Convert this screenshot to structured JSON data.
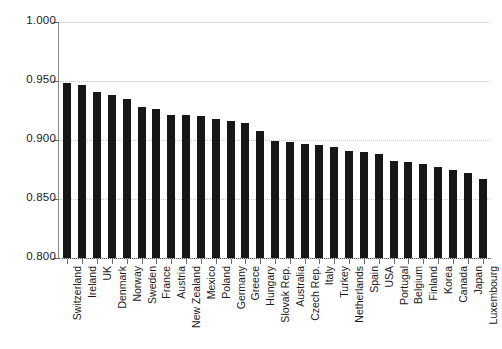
{
  "chart_data": {
    "type": "bar",
    "title": "",
    "subtitle": "",
    "xlabel": "",
    "ylabel": "",
    "ylim": [
      0.8,
      1.0
    ],
    "ytick_labels": [
      "1.000",
      "0.950",
      "0.900",
      "0.850",
      "0.800"
    ],
    "ytick_values": [
      1.0,
      0.95,
      0.9,
      0.85,
      0.8
    ],
    "grid": "horizontal-dotted",
    "legend": "none",
    "bar_color": "#171717",
    "categories": [
      "Switzerland",
      "Ireland",
      "UK",
      "Denmark",
      "Norway",
      "Sweden",
      "France",
      "Austria",
      "New Zealand",
      "Mexico",
      "Poland",
      "Germany",
      "Greece",
      "Hungary",
      "Slovak Rep.",
      "Australia",
      "Czech Rep.",
      "Italy",
      "Turkey",
      "Netherlands",
      "Spain",
      "USA",
      "Portugal",
      "Belgium",
      "Finland",
      "Korea",
      "Canada",
      "Japan",
      "Luxembourg"
    ],
    "values": [
      0.948,
      0.947,
      0.941,
      0.938,
      0.935,
      0.928,
      0.926,
      0.921,
      0.921,
      0.92,
      0.918,
      0.916,
      0.914,
      0.908,
      0.899,
      0.898,
      0.897,
      0.896,
      0.894,
      0.891,
      0.89,
      0.888,
      0.882,
      0.881,
      0.88,
      0.877,
      0.875,
      0.872,
      0.867
    ]
  }
}
